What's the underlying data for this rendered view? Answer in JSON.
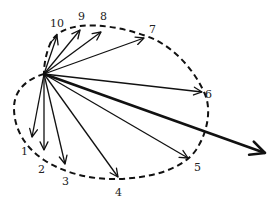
{
  "diagram": {
    "vectors": [
      {
        "id": 1,
        "label": "1"
      },
      {
        "id": 2,
        "label": "2"
      },
      {
        "id": 3,
        "label": "3"
      },
      {
        "id": 4,
        "label": "4"
      },
      {
        "id": 5,
        "label": "5"
      },
      {
        "id": 6,
        "label": "6"
      },
      {
        "id": 7,
        "label": "7"
      },
      {
        "id": 8,
        "label": "8"
      },
      {
        "id": 9,
        "label": "9"
      },
      {
        "id": 10,
        "label": "10"
      }
    ],
    "resultant": {
      "label": ""
    },
    "curve_style": "dashed",
    "stroke_color": "#111111"
  }
}
